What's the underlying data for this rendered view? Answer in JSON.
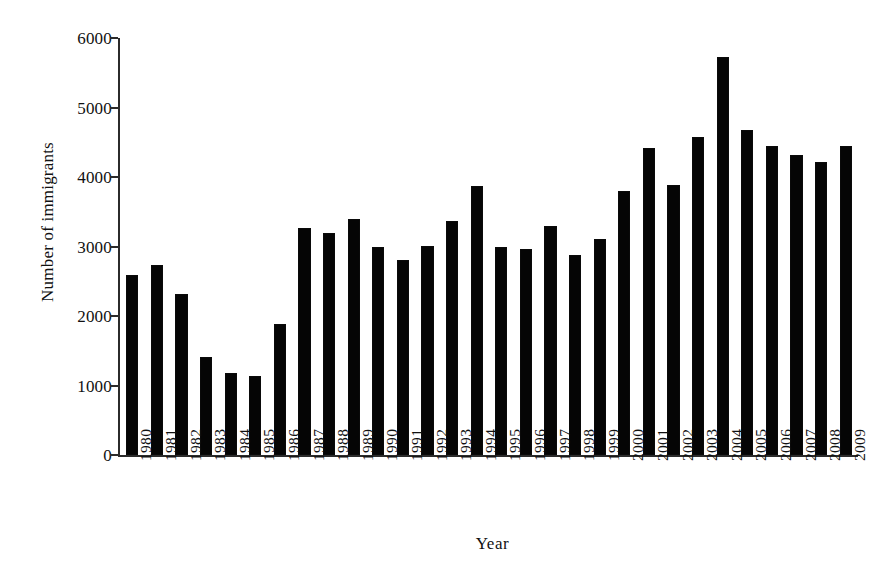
{
  "chart_data": {
    "type": "bar",
    "title": "",
    "subtitle": "",
    "xlabel": "Year",
    "ylabel": "Number of immigrants",
    "categories": [
      "1980",
      "1981",
      "1982",
      "1983",
      "1984",
      "1985",
      "1986",
      "1987",
      "1988",
      "1989",
      "1990",
      "1991",
      "1992",
      "1993",
      "1994",
      "1995",
      "1996",
      "1997",
      "1998",
      "1999",
      "2000",
      "2001",
      "2002",
      "2003",
      "2004",
      "2005",
      "2006",
      "2007",
      "2008",
      "2009"
    ],
    "values": [
      2590,
      2730,
      2310,
      1410,
      1180,
      1135,
      1885,
      3260,
      3200,
      3390,
      2990,
      2810,
      3010,
      3370,
      3870,
      3000,
      2970,
      3300,
      2880,
      3110,
      3800,
      4420,
      3890,
      4570,
      5730,
      4680,
      4440,
      4320,
      4220,
      4440
    ],
    "series": [
      {
        "name": "Number of immigrants",
        "values": [
          2590,
          2730,
          2310,
          1410,
          1180,
          1135,
          1885,
          3260,
          3200,
          3390,
          2990,
          2810,
          3010,
          3370,
          3870,
          3000,
          2970,
          3300,
          2880,
          3110,
          3800,
          4420,
          3890,
          4570,
          5730,
          4680,
          4440,
          4320,
          4220,
          4440
        ]
      }
    ],
    "ylim": [
      0,
      6000
    ],
    "yticks": [
      0,
      1000,
      2000,
      3000,
      4000,
      5000,
      6000
    ],
    "ytick_labels": [
      "0",
      "1000",
      "2000",
      "3000",
      "4000",
      "5000",
      "6000"
    ],
    "grid": false,
    "legend": false,
    "legend_position": "none",
    "bar_color": "#050505",
    "axis_color": "#2b2b2b",
    "background_color": "#ffffff"
  }
}
